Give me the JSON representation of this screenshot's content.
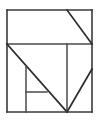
{
  "figure": {
    "shape_name": "square",
    "background_color": "#ffffff",
    "line_color": "#3a3a3a",
    "fill_color": "#ffffff",
    "stroke_width": 1.6,
    "canvas": {
      "width": 100,
      "height": 121
    },
    "outline": {
      "name": "outer-square",
      "left": 7,
      "top": 10,
      "right": 92,
      "bottom": 112,
      "width": 85,
      "height": 102
    },
    "vertices": {
      "top_left": [
        7,
        10
      ],
      "top_right": [
        92,
        10
      ],
      "bottom_left": [
        7,
        112
      ],
      "bottom_right": [
        92,
        112
      ],
      "mid_left": [
        7,
        44
      ],
      "mid_right": [
        92,
        44
      ],
      "top_notch": [
        67,
        10
      ],
      "center_stem_top": [
        67,
        44
      ],
      "bottom_apex": [
        67,
        112
      ],
      "right_diagonal_start": [
        92,
        69
      ],
      "inner_vertical_top": [
        26,
        67
      ],
      "inner_vertical_bottom": [
        26,
        112
      ],
      "inner_horizontal_right": [
        47,
        92
      ]
    },
    "segments": [
      {
        "name": "outer-top-edge",
        "type": "horizontal",
        "from": [
          7,
          10
        ],
        "to": [
          92,
          10
        ]
      },
      {
        "name": "outer-right-edge",
        "type": "vertical",
        "from": [
          92,
          10
        ],
        "to": [
          92,
          112
        ]
      },
      {
        "name": "outer-bottom-edge",
        "type": "horizontal",
        "from": [
          7,
          112
        ],
        "to": [
          92,
          112
        ]
      },
      {
        "name": "outer-left-edge",
        "type": "vertical",
        "from": [
          7,
          10
        ],
        "to": [
          7,
          112
        ]
      },
      {
        "name": "middle-horizontal-divider",
        "type": "horizontal",
        "from": [
          7,
          44
        ],
        "to": [
          92,
          44
        ]
      },
      {
        "name": "upper-right-diagonal",
        "type": "diagonal",
        "from": [
          67,
          10
        ],
        "to": [
          92,
          44
        ]
      },
      {
        "name": "main-diagonal",
        "type": "diagonal",
        "from": [
          7,
          44
        ],
        "to": [
          67,
          112
        ]
      },
      {
        "name": "center-vertical",
        "type": "vertical",
        "from": [
          67,
          44
        ],
        "to": [
          67,
          112
        ]
      },
      {
        "name": "lower-right-diagonal",
        "type": "diagonal",
        "from": [
          92,
          69
        ],
        "to": [
          67,
          112
        ]
      },
      {
        "name": "inner-vertical",
        "type": "vertical",
        "from": [
          26,
          67
        ],
        "to": [
          26,
          112
        ]
      },
      {
        "name": "inner-horizontal",
        "type": "horizontal",
        "from": [
          26,
          92
        ],
        "to": [
          47,
          92
        ]
      }
    ],
    "counts": {
      "segments": 11,
      "triangles": 4,
      "quadrilaterals": 4
    }
  }
}
